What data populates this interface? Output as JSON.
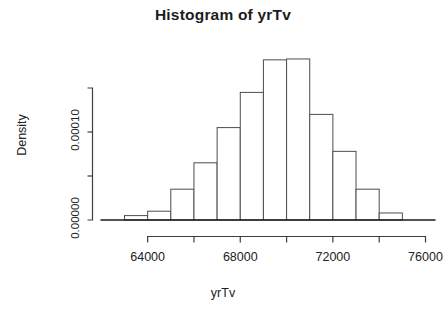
{
  "chart_data": {
    "type": "bar",
    "title": "Histogram of yrTv",
    "xlabel": "yrTv",
    "ylabel": "Density",
    "grid": false,
    "legend": null,
    "bin_width": 1000,
    "bin_edges": [
      63000,
      64000,
      65000,
      66000,
      67000,
      68000,
      69000,
      70000,
      71000,
      72000,
      73000,
      74000,
      75000
    ],
    "categories": [
      "63000-64000",
      "64000-65000",
      "65000-66000",
      "66000-67000",
      "67000-68000",
      "68000-69000",
      "69000-70000",
      "70000-71000",
      "71000-72000",
      "72000-73000",
      "73000-74000",
      "74000-75000"
    ],
    "values": [
      5e-06,
      1e-05,
      3.5e-05,
      6.5e-05,
      0.000105,
      0.000145,
      0.000182,
      0.000183,
      0.00012,
      7.8e-05,
      3.5e-05,
      8e-06
    ],
    "xlim": [
      63000,
      76000
    ],
    "ylim": [
      0,
      0.00015
    ],
    "x_ticks": [
      64000,
      65000,
      66000,
      67000,
      68000,
      69000,
      70000,
      71000,
      72000,
      73000,
      74000,
      75000,
      76000
    ],
    "x_tick_labels": [
      "64000",
      "",
      "68000",
      "",
      "72000",
      "",
      "76000"
    ],
    "x_labeled_ticks": [
      64000,
      68000,
      72000,
      76000
    ],
    "x_labeled_text": [
      "64000",
      "68000",
      "72000",
      "76000"
    ],
    "y_ticks": [
      0.0,
      5e-05,
      0.0001,
      0.00015
    ],
    "y_tick_labels": [
      "0.00000",
      "",
      "0.00010",
      ""
    ],
    "y_labeled_ticks": [
      0.0,
      0.0001
    ],
    "y_labeled_text": [
      "0.00000",
      "0.00010"
    ],
    "colors": {
      "bar_fill": "#ffffff",
      "bar_stroke": "#4d4d4d",
      "axis": "#3d3d3d",
      "text": "#222222",
      "title": "#1c1c1c",
      "background": "#ffffff"
    }
  }
}
